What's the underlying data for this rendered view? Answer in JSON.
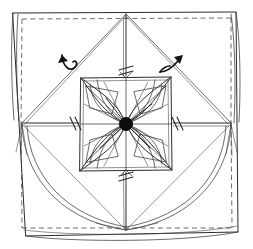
{
  "figure": {
    "title": "Origami folding diagram — twisted square / pinwheel tessellation",
    "kind": "line-drawing",
    "background_color": "#ffffff",
    "ink_color": "#2b2b2b",
    "hub_color": "#0d0d0d",
    "width": 253,
    "height": 249,
    "elements": {
      "outer_sheet_label": "outer sheet edge",
      "inner_border_label": "inner dashed crease border",
      "rosette_label": "central pinwheel rosette",
      "hub_label": "center hub",
      "arrow_left_label": "rotate-fold arrow (left)",
      "arrow_right_label": "rotate-fold arrow (right)",
      "tick_label": "crease tick mark",
      "sweep_label": "swept fold curve"
    },
    "geometry": {
      "sheet_outer": {
        "x": 10,
        "y": 12,
        "w": 233,
        "h": 224
      },
      "sheet_inner_dash": {
        "x": 20,
        "y": 18,
        "w": 212,
        "h": 208
      },
      "center": {
        "x": 126,
        "y": 124
      },
      "top_vertex": {
        "x": 126,
        "y": 14
      },
      "bottom_vertex": {
        "x": 126,
        "y": 230
      },
      "left_vertex": {
        "x": 21,
        "y": 124
      },
      "right_vertex": {
        "x": 231,
        "y": 124
      },
      "rosette_box": {
        "x": 79,
        "y": 76,
        "w": 94,
        "h": 96
      },
      "hub_radius": 6.5
    },
    "counts": {
      "petals": 8,
      "arrows": 2,
      "tick_marks": 4,
      "sweep_curves": 4
    }
  }
}
